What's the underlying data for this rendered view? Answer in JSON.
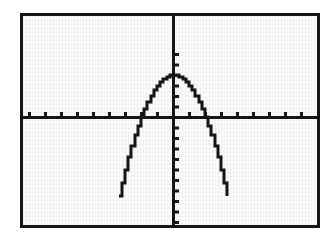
{
  "figure": {
    "kind": "graphing-calculator-screen",
    "page_background": "#ffffff",
    "screen_background": "#fbfbfb",
    "ink_color": "#151515",
    "bezel_color": "#151515",
    "bezel_width_px": 3,
    "screen": {
      "left": 20,
      "top": 13,
      "width": 300,
      "height": 215
    }
  },
  "chart_data": {
    "type": "line",
    "title": "",
    "subtitle": "",
    "xlabel": "",
    "ylabel": "",
    "grid": false,
    "legend": false,
    "legend_position": "none",
    "axis_style": "calculator-crosshair-with-tickmarks",
    "tick_labels_shown": false,
    "xlim": [
      -9.5,
      9.2
    ],
    "ylim": [
      -10.0,
      6.4
    ],
    "xticks": [
      -9,
      -8,
      -7,
      -6,
      -5,
      -4,
      -3,
      -2,
      -1,
      1,
      2,
      3,
      4,
      5,
      6,
      7,
      8,
      9
    ],
    "yticks": [
      -10,
      -9,
      -8,
      -7,
      -6,
      -5,
      -4,
      -3,
      -2,
      -1,
      1,
      2,
      3,
      4,
      5,
      6
    ],
    "x_tick_spacing_px": 16,
    "y_tick_spacing_px": 10.5,
    "tick_length_px": 4,
    "x_tick_direction": "up",
    "y_tick_direction": "right",
    "series": [
      {
        "name": "parabola",
        "equation": "y = -x^2 + 4",
        "orientation": "opens-downward",
        "vertex": [
          0,
          4
        ],
        "roots": [
          -2,
          2
        ],
        "color": "#151515",
        "line_width_px": 3,
        "render": "stepped-pixels",
        "x": [
          -3.4,
          -3.2,
          -3.0,
          -2.8,
          -2.6,
          -2.4,
          -2.2,
          -2.0,
          -1.8,
          -1.6,
          -1.4,
          -1.2,
          -1.0,
          -0.8,
          -0.6,
          -0.4,
          -0.2,
          0.0,
          0.2,
          0.4,
          0.6,
          0.8,
          1.0,
          1.2,
          1.4,
          1.6,
          1.8,
          2.0,
          2.2,
          2.4,
          2.6,
          2.8,
          3.0,
          3.2,
          3.4
        ],
        "y": [
          -7.56,
          -6.24,
          -5.0,
          -3.84,
          -2.76,
          -1.76,
          -0.84,
          0.0,
          0.76,
          1.44,
          2.04,
          2.56,
          3.0,
          3.36,
          3.64,
          3.84,
          3.96,
          4.0,
          3.96,
          3.84,
          3.64,
          3.36,
          3.0,
          2.56,
          2.04,
          1.44,
          0.76,
          0.0,
          -0.84,
          -1.76,
          -2.76,
          -3.84,
          -5.0,
          -6.24,
          -7.56
        ]
      }
    ],
    "annotations": []
  },
  "axes": {
    "x_axis_name": "x-axis",
    "y_axis_name": "y-axis",
    "origin_px": [
      173,
      117
    ]
  }
}
